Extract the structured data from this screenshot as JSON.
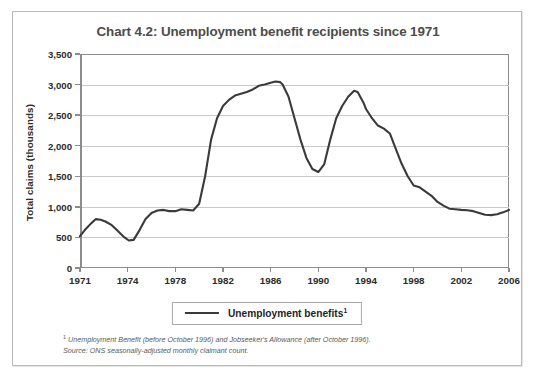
{
  "figure": {
    "title": "Chart 4.2: Unemployment benefit recipients since 1971",
    "legend_label": "Unemployment benefits",
    "legend_marker": "1",
    "footnote_marker": "1",
    "footnote_1": "Unemployment Benefit (before October 1996) and Jobseeker's Allowance (after October 1996).",
    "footnote_2": "Source: ONS seasonally-adjusted monthly claimant count.",
    "line_color": "#3a3a3a",
    "grid_color": "#c9c9c9",
    "axis_color": "#8c8c8c",
    "title_color": "#4c4c4c",
    "border_color": "#b9b9b9"
  },
  "chart_data": {
    "type": "line",
    "title": "Chart 4.2: Unemployment benefit recipients since 1971",
    "xlabel": "",
    "ylabel": "Total claims (thousands)",
    "ylim": [
      0,
      3500
    ],
    "xlim": [
      1971,
      2006
    ],
    "grid": true,
    "legend_position": "bottom",
    "ytick_labels": [
      "0",
      "500",
      "1,000",
      "1,500",
      "2,000",
      "2,500",
      "3,000",
      "3,500"
    ],
    "yticks": [
      0,
      500,
      1000,
      1500,
      2000,
      2500,
      3000,
      3500
    ],
    "xtick_labels": [
      "1971",
      "1974",
      "1978",
      "1982",
      "1986",
      "1990",
      "1994",
      "1998",
      "2002",
      "2006"
    ],
    "xticks": [
      1971,
      1974,
      1978,
      1982,
      1986,
      1990,
      1994,
      1998,
      2002,
      2006
    ],
    "series": [
      {
        "name": "Unemployment benefits",
        "color": "#3a3a3a",
        "x": [
          1971.0,
          1971.3,
          1971.7,
          1972.0,
          1972.3,
          1972.6,
          1973.0,
          1973.4,
          1973.8,
          1974.1,
          1974.5,
          1975.0,
          1975.5,
          1976.0,
          1976.5,
          1977.0,
          1977.5,
          1978.0,
          1978.5,
          1979.0,
          1979.5,
          1980.0,
          1980.5,
          1981.0,
          1981.5,
          1982.0,
          1982.5,
          1983.0,
          1983.5,
          1984.0,
          1984.5,
          1985.0,
          1985.5,
          1986.0,
          1986.4,
          1986.8,
          1987.0,
          1987.5,
          1988.0,
          1988.5,
          1989.0,
          1989.5,
          1990.0,
          1990.5,
          1991.0,
          1991.5,
          1992.0,
          1992.5,
          1993.0,
          1993.3,
          1993.8,
          1994.0,
          1994.5,
          1995.0,
          1995.5,
          1996.0,
          1996.5,
          1997.0,
          1997.5,
          1998.0,
          1998.5,
          1999.0,
          1999.5,
          2000.0,
          2000.5,
          2001.0,
          2001.5,
          2002.0,
          2002.5,
          2003.0,
          2003.5,
          2004.0,
          2004.5,
          2005.0,
          2005.5,
          2006.0
        ],
        "y": [
          520,
          620,
          730,
          800,
          790,
          760,
          700,
          600,
          500,
          450,
          460,
          620,
          800,
          900,
          940,
          950,
          930,
          930,
          960,
          950,
          940,
          1050,
          1500,
          2100,
          2450,
          2650,
          2750,
          2820,
          2850,
          2880,
          2920,
          2980,
          3000,
          3030,
          3050,
          3040,
          3000,
          2800,
          2450,
          2100,
          1800,
          1620,
          1570,
          1700,
          2100,
          2450,
          2650,
          2800,
          2900,
          2880,
          2700,
          2600,
          2450,
          2330,
          2280,
          2200,
          1950,
          1700,
          1500,
          1350,
          1320,
          1250,
          1180,
          1080,
          1020,
          970,
          960,
          950,
          945,
          930,
          900,
          870,
          865,
          880,
          910,
          950
        ]
      }
    ]
  }
}
